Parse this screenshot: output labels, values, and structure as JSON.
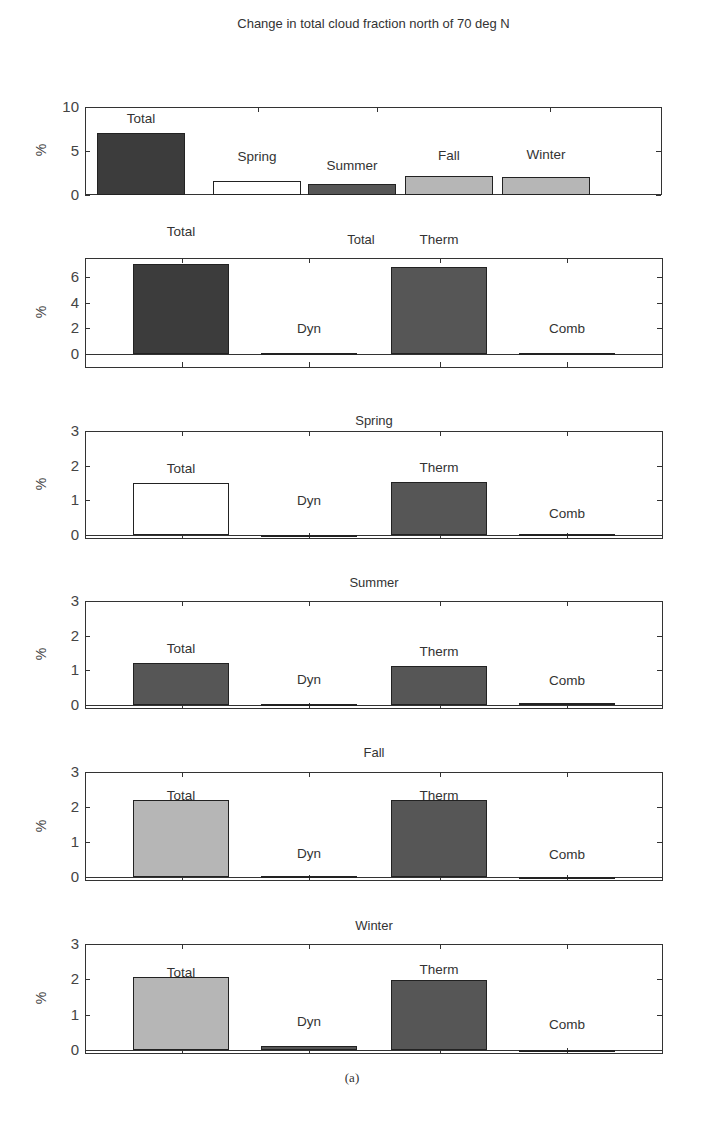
{
  "figure": {
    "caption": "(a)"
  },
  "colors": {
    "total_annual": "#3c3c3c",
    "dark": "#565656",
    "white": "#ffffff",
    "light": "#b6b6b6"
  },
  "chart_data": [
    {
      "type": "bar",
      "title": "Change in total cloud fraction north of 70 deg N",
      "ylabel": "%",
      "xlabel": "",
      "ylim": [
        0,
        10
      ],
      "yticks": [
        0,
        5,
        10
      ],
      "grid": false,
      "categories": [
        "Total",
        "Spring",
        "Summer",
        "Fall",
        "Winter"
      ],
      "values": [
        7.0,
        1.6,
        1.2,
        2.2,
        2.1
      ],
      "bar_colors": [
        "#3c3c3c",
        "#ffffff",
        "#565656",
        "#b6b6b6",
        "#b6b6b6"
      ]
    },
    {
      "type": "bar",
      "title": "Total",
      "ylabel": "%",
      "ylim": [
        -1.1,
        7.5
      ],
      "yticks": [
        0,
        2,
        4,
        6
      ],
      "grid": false,
      "categories": [
        "Total",
        "Dyn",
        "Therm",
        "Comb"
      ],
      "values": [
        7.0,
        0.1,
        6.8,
        0.1
      ],
      "bar_colors": [
        "#3c3c3c",
        "#3c3c3c",
        "#565656",
        "#3c3c3c"
      ]
    },
    {
      "type": "bar",
      "title": "Spring",
      "ylabel": "%",
      "ylim": [
        -0.12,
        3
      ],
      "yticks": [
        0,
        1,
        2,
        3
      ],
      "grid": false,
      "categories": [
        "Total",
        "Dyn",
        "Therm",
        "Comb"
      ],
      "values": [
        1.5,
        0.0,
        1.52,
        0.03
      ],
      "bar_colors": [
        "#ffffff",
        "#565656",
        "#565656",
        "#565656"
      ]
    },
    {
      "type": "bar",
      "title": "Summer",
      "ylabel": "%",
      "ylim": [
        -0.12,
        3
      ],
      "yticks": [
        0,
        1,
        2,
        3
      ],
      "grid": false,
      "categories": [
        "Total",
        "Dyn",
        "Therm",
        "Comb"
      ],
      "values": [
        1.2,
        0.03,
        1.12,
        0.04
      ],
      "bar_colors": [
        "#565656",
        "#565656",
        "#565656",
        "#565656"
      ]
    },
    {
      "type": "bar",
      "title": "Fall",
      "ylabel": "%",
      "ylim": [
        -0.12,
        3
      ],
      "yticks": [
        0,
        1,
        2,
        3
      ],
      "grid": false,
      "categories": [
        "Total",
        "Dyn",
        "Therm",
        "Comb"
      ],
      "values": [
        2.2,
        0.03,
        2.2,
        -0.02
      ],
      "bar_colors": [
        "#b6b6b6",
        "#565656",
        "#565656",
        "#565656"
      ]
    },
    {
      "type": "bar",
      "title": "Winter",
      "ylabel": "%",
      "ylim": [
        -0.12,
        3
      ],
      "yticks": [
        0,
        1,
        2,
        3
      ],
      "grid": false,
      "categories": [
        "Total",
        "Dyn",
        "Therm",
        "Comb"
      ],
      "values": [
        2.05,
        0.12,
        1.98,
        -0.03
      ],
      "bar_colors": [
        "#b6b6b6",
        "#565656",
        "#565656",
        "#565656"
      ]
    }
  ],
  "layout": [
    {
      "title_y": 16,
      "top": 107,
      "bottom": 195,
      "left": 85,
      "right": 662,
      "centers": [
        141,
        257,
        352,
        449,
        546
      ],
      "bar_w": 88,
      "label_offsets": [
        -22,
        -32,
        -26,
        -28,
        -30
      ],
      "ticks_x": [
        258,
        377,
        550
      ]
    },
    {
      "title_y": 232,
      "top": 258,
      "bottom": 368,
      "left": 85,
      "right": 663,
      "centers": [
        181,
        309,
        439,
        567
      ],
      "bar_w": 96,
      "label_offsets": [
        -42,
        -32,
        -35,
        -32
      ],
      "ticks_x": [
        182,
        309,
        440,
        567
      ],
      "total_label_y": 224,
      "title_x": 361
    },
    {
      "title_y": 413,
      "top": 431,
      "bottom": 539,
      "left": 85,
      "right": 663,
      "centers": [
        181,
        309,
        439,
        567
      ],
      "bar_w": 96,
      "label_offsets": [
        -22,
        -42,
        -22,
        -28
      ],
      "ticks_x": [
        182,
        309,
        440,
        567
      ]
    },
    {
      "title_y": 575,
      "top": 601,
      "bottom": 709,
      "left": 85,
      "right": 663,
      "centers": [
        181,
        309,
        439,
        567
      ],
      "bar_w": 96,
      "label_offsets": [
        -22,
        -32,
        -22,
        -30
      ],
      "ticks_x": [
        182,
        309,
        440,
        567
      ]
    },
    {
      "title_y": 745,
      "top": 772,
      "bottom": 881,
      "left": 85,
      "right": 663,
      "centers": [
        181,
        309,
        439,
        567
      ],
      "bar_w": 96,
      "label_offsets": [
        -12,
        -30,
        -12,
        -30
      ],
      "ticks_x": [
        182,
        309,
        440,
        567
      ]
    },
    {
      "title_y": 918,
      "top": 944,
      "bottom": 1054,
      "left": 85,
      "right": 663,
      "centers": [
        181,
        309,
        439,
        567
      ],
      "bar_w": 96,
      "label_offsets": [
        -12,
        -32,
        -18,
        -33
      ],
      "ticks_x": [
        182,
        309,
        440,
        567
      ]
    }
  ]
}
